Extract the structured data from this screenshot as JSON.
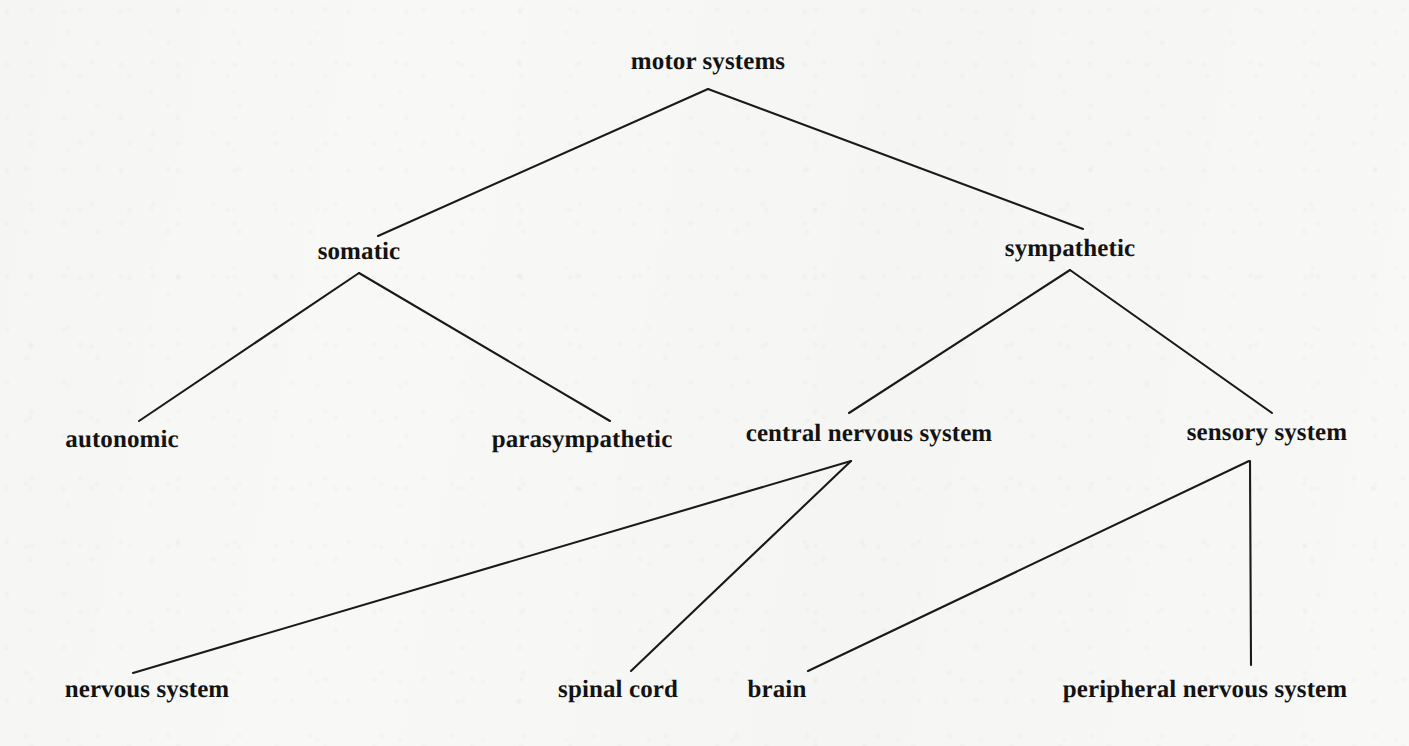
{
  "diagram": {
    "type": "tree",
    "title": "motor systems",
    "background_color": "#f8f8f6",
    "line_color": "#1a1a1a",
    "text_color": "#131313",
    "nodes": [
      {
        "id": "motor_systems",
        "label": "motor systems",
        "x": 708,
        "y": 62,
        "level": 0
      },
      {
        "id": "somatic",
        "label": "somatic",
        "x": 359,
        "y": 252,
        "level": 1
      },
      {
        "id": "sympathetic",
        "label": "sympathetic",
        "x": 1070,
        "y": 249,
        "level": 1
      },
      {
        "id": "autonomic",
        "label": "autonomic",
        "x": 122,
        "y": 440,
        "level": 2
      },
      {
        "id": "parasympathetic",
        "label": "parasympathetic",
        "x": 582,
        "y": 440,
        "level": 2
      },
      {
        "id": "central_nervous_system",
        "label": "central nervous system",
        "x": 869,
        "y": 434,
        "level": 2
      },
      {
        "id": "sensory_system",
        "label": "sensory system",
        "x": 1267,
        "y": 433,
        "level": 2
      },
      {
        "id": "nervous_system",
        "label": "nervous system",
        "x": 147,
        "y": 690,
        "level": 3
      },
      {
        "id": "spinal_cord",
        "label": "spinal cord",
        "x": 618,
        "y": 690,
        "level": 3
      },
      {
        "id": "brain",
        "label": "brain",
        "x": 777,
        "y": 690,
        "level": 3
      },
      {
        "id": "peripheral_nervous_system",
        "label": "peripheral nervous system",
        "x": 1205,
        "y": 690,
        "level": 3
      }
    ],
    "edges": [
      {
        "id": "edge-motor-somatic",
        "from": "motor_systems",
        "to": "somatic",
        "x1": 708,
        "y1": 89,
        "x2": 378,
        "y2": 236
      },
      {
        "id": "edge-motor-sympathetic",
        "from": "motor_systems",
        "to": "sympathetic",
        "x1": 708,
        "y1": 89,
        "x2": 1083,
        "y2": 229
      },
      {
        "id": "edge-somatic-autonomic",
        "from": "somatic",
        "to": "autonomic",
        "x1": 359,
        "y1": 273,
        "x2": 139,
        "y2": 421
      },
      {
        "id": "edge-somatic-parasympathetic",
        "from": "somatic",
        "to": "parasympathetic",
        "x1": 359,
        "y1": 273,
        "x2": 610,
        "y2": 421
      },
      {
        "id": "edge-sympathetic-cns",
        "from": "sympathetic",
        "to": "central_nervous_system",
        "x1": 1070,
        "y1": 270,
        "x2": 849,
        "y2": 413
      },
      {
        "id": "edge-sympathetic-sensory",
        "from": "sympathetic",
        "to": "sensory_system",
        "x1": 1070,
        "y1": 270,
        "x2": 1272,
        "y2": 413
      },
      {
        "id": "edge-cns-nervous-system",
        "from": "central_nervous_system",
        "to": "nervous_system",
        "x1": 851,
        "y1": 461,
        "x2": 133,
        "y2": 673
      },
      {
        "id": "edge-cns-spinal-cord",
        "from": "central_nervous_system",
        "to": "spinal_cord",
        "x1": 851,
        "y1": 461,
        "x2": 631,
        "y2": 671
      },
      {
        "id": "edge-sensory-brain",
        "from": "sensory_system",
        "to": "brain",
        "x1": 1249,
        "y1": 461,
        "x2": 808,
        "y2": 671
      },
      {
        "id": "edge-sensory-peripheral",
        "from": "sensory_system",
        "to": "peripheral_nervous_system",
        "x1": 1250,
        "y1": 461,
        "x2": 1251,
        "y2": 665
      }
    ]
  }
}
